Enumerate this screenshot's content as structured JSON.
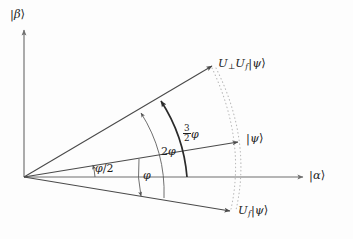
{
  "figure": {
    "kind": "vector-diagram",
    "caption": "Grover amplitude-amplification rotation diagram in the |alpha>,|beta> plane",
    "background_color": "#fdfdfd",
    "axis_color": "#6f6f6f",
    "ray_color": "#4a4a4a",
    "arc_color": "#555555",
    "emphasis_arc_color": "#2a2a2a",
    "dotted_arc_color": "#b9b9b9"
  },
  "axes": {
    "vertical": {
      "label": "|β⟩",
      "label_parts": {
        "bar": "|",
        "symbol": "β",
        "ket": "⟩"
      }
    },
    "horizontal": {
      "label": "|α⟩",
      "label_parts": {
        "bar": "|",
        "symbol": "α",
        "ket": "⟩"
      }
    },
    "origin": {
      "x": 24,
      "y": 177
    }
  },
  "vectors": [
    {
      "id": "u-perp-uf-psi",
      "label": "U⊥Uf|ψ⟩",
      "label_parts": {
        "u1": "U",
        "u1_sub": "⊥",
        "u2": "U",
        "u2_sub": "f",
        "bar": "|",
        "symbol": "ψ",
        "ket": "⟩"
      },
      "angle_from_alpha_axis": "3φ/2 above |ψ⟩ direction",
      "tip": {
        "x": 214,
        "y": 65
      }
    },
    {
      "id": "psi",
      "label": "|ψ⟩",
      "label_parts": {
        "bar": "|",
        "symbol": "ψ",
        "ket": "⟩"
      },
      "angle_from_alpha_axis": "φ/2",
      "tip": {
        "x": 241,
        "y": 141
      }
    },
    {
      "id": "uf-psi",
      "label": "Uf|ψ⟩",
      "label_parts": {
        "u": "U",
        "u_sub": "f",
        "bar": "|",
        "symbol": "ψ",
        "ket": "⟩"
      },
      "angle_from_alpha_axis": "-φ/2 (reflected below axis)",
      "tip": {
        "x": 233,
        "y": 212
      }
    }
  ],
  "angle_annotations": [
    {
      "id": "phi-half",
      "label": "φ/2",
      "label_parts": {
        "symbol": "φ",
        "divider": "/2"
      },
      "description": "angle between |α⟩ axis and |ψ⟩",
      "value_expression": "φ/2"
    },
    {
      "id": "phi",
      "label": "φ",
      "label_parts": {
        "symbol": "φ"
      },
      "description": "angle between |ψ⟩ and Uf|ψ⟩",
      "value_expression": "φ"
    },
    {
      "id": "two-phi",
      "label": "2φ",
      "label_parts": {
        "coefficient": "2",
        "symbol": "φ"
      },
      "description": "angle between Uf|ψ⟩ and U⊥Uf|ψ⟩",
      "value_expression": "2φ"
    },
    {
      "id": "three-half-phi",
      "label": "3/2 φ",
      "label_parts": {
        "numerator": "3",
        "denominator": "2",
        "symbol": "φ"
      },
      "description": "angle between |ψ⟩ and U⊥Uf|ψ⟩",
      "value_expression": "(3/2)φ"
    }
  ]
}
